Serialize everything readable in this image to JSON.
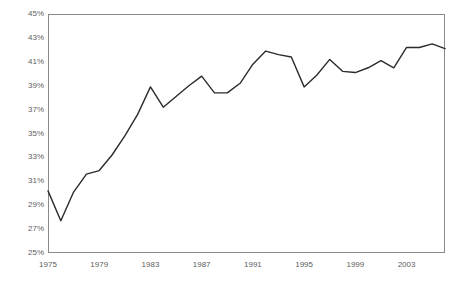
{
  "chart_data": {
    "type": "line",
    "title": "",
    "xlabel": "",
    "ylabel": "",
    "grid": false,
    "legend": "none",
    "xlim": [
      1975,
      2006
    ],
    "ylim": [
      25,
      45
    ],
    "y_tick_labels": [
      "45%",
      "43%",
      "41%",
      "39%",
      "37%",
      "35%",
      "33%",
      "31%",
      "29%",
      "27%",
      "25%"
    ],
    "y_ticks": [
      45,
      43,
      41,
      39,
      37,
      35,
      33,
      31,
      29,
      27,
      25
    ],
    "x_tick_labels": [
      "1975",
      "1979",
      "1983",
      "1987",
      "1991",
      "1995",
      "1999",
      "2003"
    ],
    "x_ticks": [
      1975,
      1979,
      1983,
      1987,
      1991,
      1995,
      1999,
      2003
    ],
    "series": [
      {
        "name": "share",
        "color": "#2b2b2b",
        "x": [
          1975,
          1976,
          1977,
          1978,
          1979,
          1980,
          1981,
          1982,
          1983,
          1984,
          1985,
          1986,
          1987,
          1988,
          1989,
          1990,
          1991,
          1992,
          1993,
          1994,
          1995,
          1996,
          1997,
          1998,
          1999,
          2000,
          2001,
          2002,
          2003,
          2004,
          2005,
          2006
        ],
        "values": [
          30.2,
          27.7,
          30.1,
          31.6,
          31.9,
          33.2,
          34.8,
          36.6,
          38.9,
          37.2,
          38.1,
          39.0,
          39.8,
          38.4,
          38.4,
          39.2,
          40.8,
          41.9,
          41.6,
          41.4,
          38.9,
          39.9,
          41.2,
          40.2,
          40.1,
          40.5,
          41.1,
          40.5,
          42.2,
          42.2,
          42.5,
          42.1
        ]
      }
    ]
  }
}
